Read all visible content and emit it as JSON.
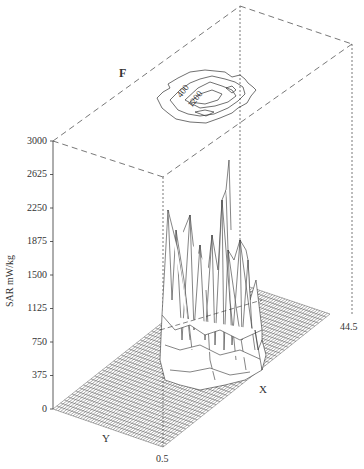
{
  "chart_data": {
    "type": "surface3d",
    "title": "",
    "panel_label": "F",
    "zlabel": "SAR mW/kg",
    "xlabel": "X",
    "ylabel": "Y",
    "zlim": [
      0,
      3000
    ],
    "z_ticks": [
      0,
      375,
      750,
      1125,
      1500,
      1875,
      2250,
      2625,
      3000
    ],
    "x_range_labels": [
      "0.5",
      "44.5"
    ],
    "grid": true,
    "projection": {
      "contour_on_top_plane": true,
      "contour_levels_labeled": [
        400,
        1200
      ]
    },
    "peak_estimate": 2900
  },
  "labels": {
    "panel": "F",
    "zaxis": "SAR mW/kg",
    "x": "X",
    "y": "Y",
    "x_start": "0.5",
    "x_end": "44.5",
    "contour_400": "400",
    "contour_1200": "1200",
    "ticks": [
      "3000",
      "2625",
      "2250",
      "1875",
      "1500",
      "1125",
      "750",
      "375",
      "0"
    ]
  },
  "colors": {
    "line": "#444444",
    "dashed": "#555555",
    "background": "#ffffff"
  }
}
